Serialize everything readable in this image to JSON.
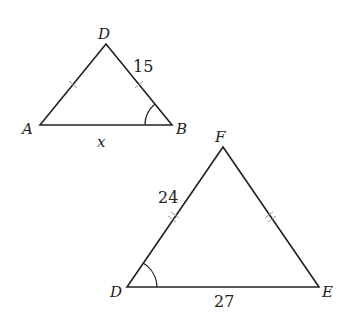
{
  "triangle_abd": {
    "vertices": {
      "A": "A",
      "B": "B",
      "D": "D"
    },
    "side_db": "15",
    "side_ab": "x",
    "tick_marks": "AD and DB marked equal (single tick)",
    "angle_mark": "B"
  },
  "triangle_def": {
    "vertices": {
      "D": "D",
      "E": "E",
      "F": "F"
    },
    "side_df": "24",
    "side_de": "27",
    "tick_marks": "DF and FE marked equal (double tick)",
    "angle_mark": "D"
  }
}
